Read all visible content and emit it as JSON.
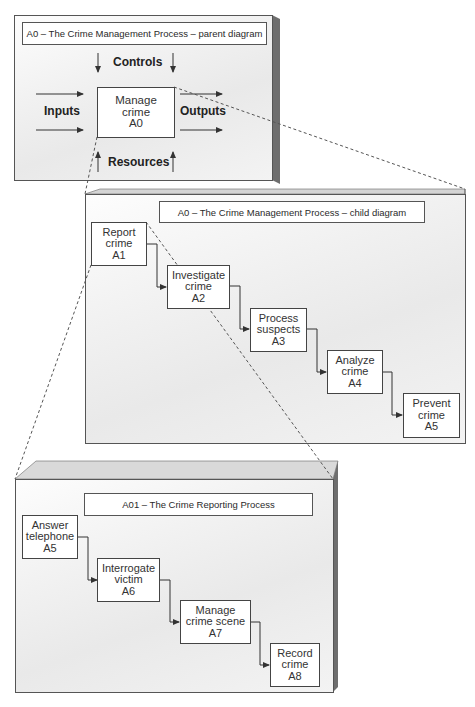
{
  "parent_diagram": {
    "title": "A0 – The Crime Management Process – parent diagram",
    "labels": {
      "controls": "Controls",
      "inputs": "Inputs",
      "outputs": "Outputs",
      "resources": "Resources"
    },
    "activity": {
      "line1": "Manage",
      "line2": "crime",
      "id": "A0"
    }
  },
  "child_diagram": {
    "title": "A0 – The Crime Management Process – child diagram",
    "activities": [
      {
        "line1": "Report",
        "line2": "crime",
        "id": "A1"
      },
      {
        "line1": "Investigate",
        "line2": "crime",
        "id": "A2"
      },
      {
        "line1": "Process",
        "line2": "suspects",
        "id": "A3"
      },
      {
        "line1": "Analyze",
        "line2": "crime",
        "id": "A4"
      },
      {
        "line1": "Prevent",
        "line2": "crime",
        "id": "A5"
      }
    ]
  },
  "grandchild_diagram": {
    "title": "A01 –  The Crime Reporting Process",
    "activities": [
      {
        "line1": "Answer",
        "line2": "telephone",
        "id": "A5"
      },
      {
        "line1": "Interrogate",
        "line2": "victim",
        "id": "A6"
      },
      {
        "line1": "Manage",
        "line2": "crime scene",
        "id": "A7"
      },
      {
        "line1": "Record",
        "line2": "crime",
        "id": "A8"
      }
    ]
  },
  "colors": {
    "panel_side": "#6e6e6e",
    "panel_top": "#d4d4d4",
    "line": "#444444",
    "dashed": "#555555"
  }
}
